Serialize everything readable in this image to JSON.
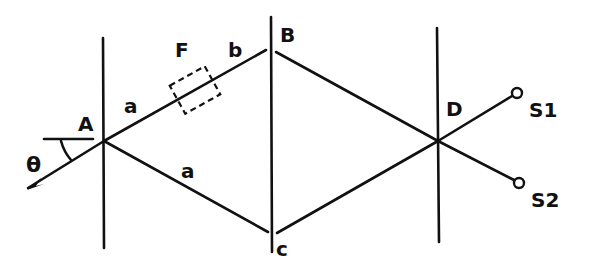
{
  "diagram": {
    "type": "interferometer-schematic",
    "colors": {
      "line": "#111111",
      "background": "#ffffff"
    },
    "labels": {
      "A": "A",
      "B": "B",
      "C": "c",
      "D": "D",
      "F": "F",
      "a_upper": "a",
      "a_lower": "a",
      "b": "b",
      "theta": "θ",
      "S1": "S1",
      "S2": "S2"
    },
    "nodes": {
      "A": {
        "x": 104,
        "y": 141
      },
      "B": {
        "x": 272,
        "y": 50
      },
      "C": {
        "x": 272,
        "y": 235
      },
      "D": {
        "x": 438,
        "y": 141
      },
      "S1": {
        "x": 517,
        "y": 93
      },
      "S2": {
        "x": 519,
        "y": 183
      }
    },
    "elements": [
      {
        "name": "beam-splitter-A",
        "kind": "vertical-line"
      },
      {
        "name": "mirror-B-C",
        "kind": "vertical-line"
      },
      {
        "name": "beam-splitter-D",
        "kind": "vertical-line"
      },
      {
        "name": "filter-F",
        "kind": "dashed-box"
      },
      {
        "name": "detector-S1",
        "kind": "circle"
      },
      {
        "name": "detector-S2",
        "kind": "circle"
      }
    ]
  }
}
